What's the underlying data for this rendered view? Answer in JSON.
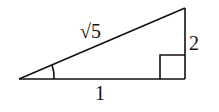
{
  "diagram": {
    "type": "right-triangle",
    "labels": {
      "hypotenuse": "√5",
      "vertical_leg": "2",
      "horizontal_leg": "1"
    },
    "marks": {
      "angle_arc": "acute angle at left vertex",
      "right_angle": "right angle at bottom-right vertex"
    },
    "stroke_color": "#111111"
  }
}
